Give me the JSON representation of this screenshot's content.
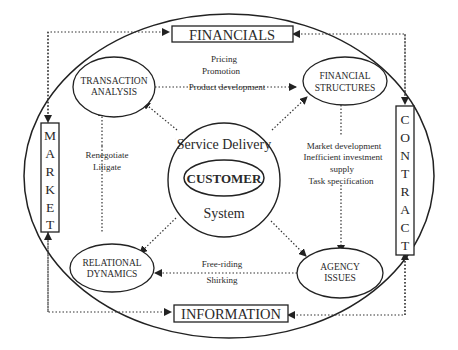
{
  "diagram": {
    "boxes": {
      "top": "FINANCIALS",
      "bottom": "INFORMATION",
      "left_letters": [
        "M",
        "A",
        "R",
        "K",
        "E",
        "T"
      ],
      "right_letters": [
        "C",
        "O",
        "N",
        "T",
        "R",
        "A",
        "C",
        "T"
      ]
    },
    "left_label": "MARKET",
    "right_label": "CONTRACT",
    "nodes": {
      "top_left": [
        "TRANSACTION",
        "ANALYSIS"
      ],
      "top_right": [
        "FINANCIAL",
        "STRUCTURES"
      ],
      "bottom_left": [
        "RELATIONAL",
        "DYNAMICS"
      ],
      "bottom_right": [
        "AGENCY",
        "ISSUES"
      ]
    },
    "center": {
      "outer_top": "Service Delivery",
      "inner": "CUSTOMER",
      "outer_bottom": "System"
    },
    "edge_labels": {
      "top": [
        "Pricing",
        "Promotion",
        "Product development"
      ],
      "right": [
        "Market development",
        "Inefficient investment",
        "supply",
        "Task specification"
      ],
      "bottom": [
        "Free-riding",
        "Shirking"
      ],
      "left": [
        "Renegotiate",
        "Litigate"
      ]
    }
  }
}
